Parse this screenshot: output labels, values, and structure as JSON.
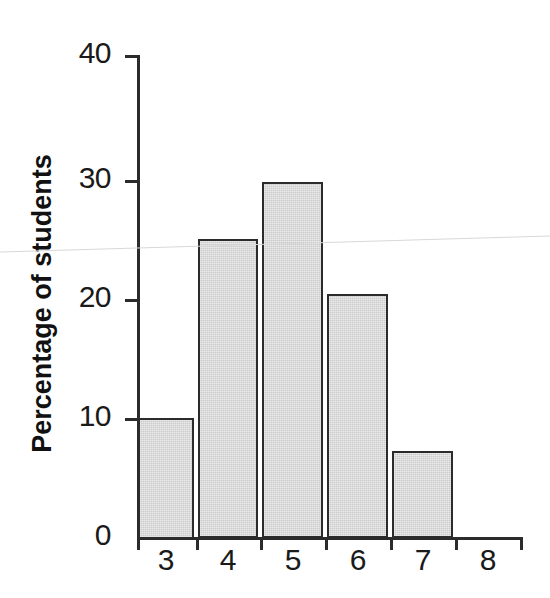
{
  "chart_data": {
    "type": "bar",
    "title": "",
    "subtitle": "",
    "xlabel": "",
    "ylabel": "Percentage of students",
    "categories": [
      "3",
      "4",
      "5",
      "6",
      "7",
      "8"
    ],
    "values": [
      10,
      24.8,
      29.5,
      20.2,
      7.2,
      0
    ],
    "ylim": [
      0,
      40
    ],
    "y_ticks": [
      0,
      10,
      20,
      30,
      40
    ],
    "y_tick_labels": [
      "0",
      "10",
      "20",
      "30",
      "40"
    ],
    "x_tick_labels": [
      "3",
      "4",
      "5",
      "6",
      "7",
      "8"
    ],
    "grid": false,
    "legend": null,
    "legend_position": "none",
    "bar_fill_color": "#cbcbcb",
    "bar_edge_color": "#2b2b2b",
    "axis_color": "#2b2b2b",
    "background_color": "#ffffff",
    "annotations": []
  },
  "axes": {
    "y_title": "Percentage of students",
    "y_tick_labels": [
      "40",
      "30",
      "20",
      "10",
      "0"
    ],
    "x_tick_labels": [
      "3",
      "4",
      "5",
      "6",
      "7",
      "8"
    ]
  }
}
